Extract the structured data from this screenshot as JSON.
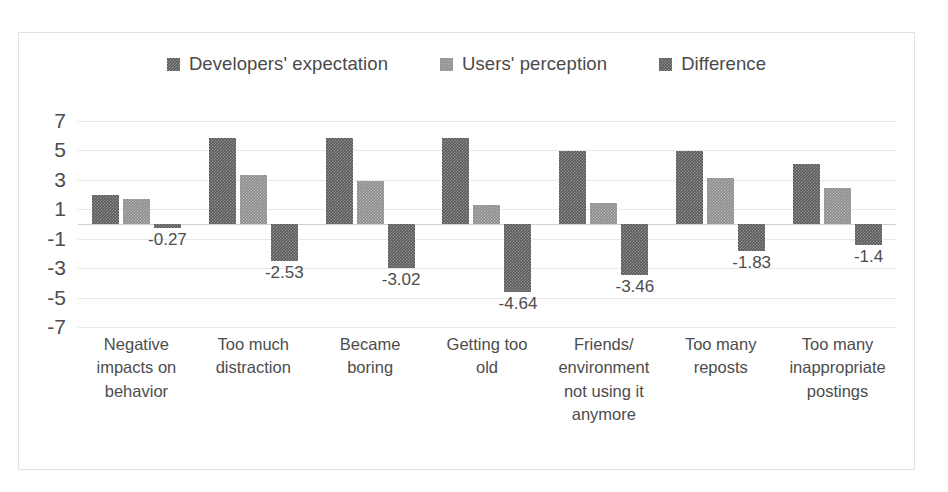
{
  "chart_data": {
    "type": "bar",
    "title": "",
    "subtitle": "",
    "xlabel": "",
    "ylabel": "",
    "ylim": [
      -7,
      7
    ],
    "yticks": [
      7,
      5,
      3,
      1,
      -1,
      -3,
      -5,
      -7
    ],
    "grid": true,
    "legend_position": "top-center",
    "categories": [
      "Negative impacts on behavior",
      "Too much distraction",
      "Became boring",
      "Getting too old",
      "Friends/ environment not using it anymore",
      "Too many reposts",
      "Too many inappropriate postings"
    ],
    "category_lines": [
      [
        "Negative",
        "impacts on",
        "behavior"
      ],
      [
        "Too much",
        "distraction"
      ],
      [
        "Became",
        "boring"
      ],
      [
        "Getting too",
        "old"
      ],
      [
        "Friends/",
        "environment",
        "not using it",
        "anymore"
      ],
      [
        "Too many",
        "reposts"
      ],
      [
        "Too many",
        "inappropriate",
        "postings"
      ]
    ],
    "series": [
      {
        "name": "Developers' expectation",
        "color": "#595959",
        "values": [
          1.95,
          5.85,
          5.82,
          5.82,
          4.97,
          4.95,
          4.08
        ],
        "show_labels": false
      },
      {
        "name": "Users' perception",
        "color": "#8c8c8c",
        "values": [
          1.68,
          3.32,
          2.95,
          1.26,
          1.42,
          3.12,
          2.42
        ],
        "show_labels": false
      },
      {
        "name": "Difference",
        "color": "#595959",
        "values": [
          -0.27,
          -2.53,
          -3.02,
          -4.64,
          -3.46,
          -1.83,
          -1.4
        ],
        "show_labels": true,
        "labels": [
          "-0.27",
          "-2.53",
          "-3.02",
          "-4.64",
          "-3.46",
          "-1.83",
          "-1.4"
        ]
      }
    ]
  }
}
